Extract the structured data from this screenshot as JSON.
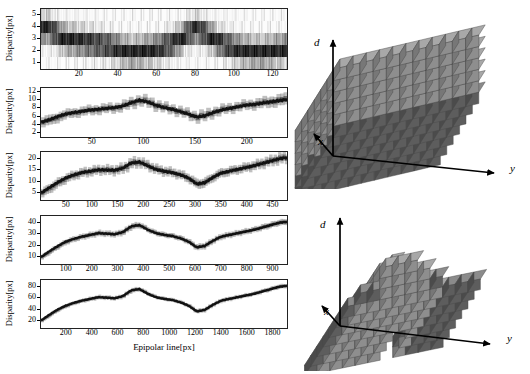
{
  "figure": {
    "background": "#ffffff",
    "ink_color": "#000000"
  },
  "left_panels": {
    "shared_ylabel": "Disparity[px]",
    "shared_xlabel": "Epipolar line[px]"
  },
  "chart_data": [
    {
      "type": "line",
      "name": "scale-1",
      "title": "",
      "xlabel": "",
      "ylabel": "Disparity[px]",
      "xlim": [
        0,
        128
      ],
      "ylim": [
        0.5,
        5.5
      ],
      "xticks": [
        20,
        40,
        60,
        80,
        100,
        120
      ],
      "yticks": [
        1,
        2,
        3,
        4,
        5
      ],
      "grid": false,
      "render": "heatmap-band",
      "x": [
        0,
        4,
        8,
        12,
        16,
        20,
        24,
        28,
        32,
        36,
        40,
        44,
        48,
        52,
        56,
        60,
        64,
        68,
        72,
        76,
        80,
        84,
        88,
        92,
        96,
        100,
        104,
        108,
        112,
        116,
        120,
        124,
        128
      ],
      "values": [
        2.1,
        2.2,
        2.6,
        3.0,
        3.1,
        3.2,
        3.3,
        3.4,
        3.5,
        3.6,
        3.8,
        4.0,
        4.1,
        4.0,
        3.9,
        3.8,
        3.6,
        3.4,
        3.1,
        2.6,
        2.2,
        2.4,
        2.8,
        3.2,
        3.5,
        3.7,
        3.9,
        4.0,
        4.1,
        4.1,
        4.0,
        3.9,
        3.8
      ],
      "band": [
        0.9,
        0.9,
        0.9,
        0.9,
        0.9,
        0.9,
        0.9,
        0.9,
        0.9,
        0.9,
        0.9,
        0.9,
        0.9,
        0.9,
        0.9,
        0.9,
        0.9,
        0.9,
        0.9,
        0.9,
        0.9,
        0.9,
        0.9,
        0.9,
        0.9,
        0.9,
        0.9,
        0.9,
        0.9,
        0.9,
        0.9,
        0.9,
        0.9
      ]
    },
    {
      "type": "line",
      "name": "scale-2",
      "title": "",
      "xlabel": "",
      "ylabel": "Disparity[px]",
      "xlim": [
        0,
        240
      ],
      "ylim": [
        1,
        13
      ],
      "xticks": [
        50,
        100,
        150,
        200
      ],
      "yticks": [
        2,
        4,
        6,
        8,
        10,
        12
      ],
      "grid": false,
      "render": "heatmap-band",
      "x": [
        0,
        8,
        16,
        24,
        32,
        40,
        48,
        56,
        64,
        72,
        80,
        88,
        96,
        104,
        112,
        120,
        128,
        136,
        144,
        152,
        160,
        168,
        176,
        184,
        192,
        200,
        208,
        216,
        224,
        232,
        240
      ],
      "values": [
        4.6,
        5.2,
        6.0,
        6.6,
        7.0,
        7.3,
        7.6,
        7.8,
        8.0,
        8.2,
        8.6,
        9.4,
        10.0,
        9.6,
        8.8,
        8.2,
        7.8,
        7.2,
        6.6,
        5.9,
        6.2,
        7.0,
        7.6,
        8.0,
        8.4,
        8.8,
        9.0,
        9.3,
        9.6,
        9.9,
        10.2
      ],
      "band": [
        2.0,
        2.0,
        1.9,
        1.8,
        1.8,
        1.8,
        1.8,
        1.8,
        1.8,
        1.8,
        1.9,
        2.0,
        2.0,
        2.0,
        1.9,
        1.8,
        1.8,
        1.8,
        1.8,
        2.0,
        2.0,
        1.9,
        1.8,
        1.8,
        1.8,
        1.8,
        1.9,
        2.0,
        2.1,
        2.2,
        2.4
      ]
    },
    {
      "type": "line",
      "name": "scale-3",
      "title": "",
      "xlabel": "",
      "ylabel": "Disparity[px]",
      "xlim": [
        0,
        480
      ],
      "ylim": [
        2,
        23
      ],
      "xticks": [
        50,
        100,
        150,
        200,
        250,
        300,
        350,
        400,
        450
      ],
      "yticks": [
        5,
        10,
        15,
        20
      ],
      "grid": false,
      "render": "heatmap-band",
      "x": [
        0,
        16,
        32,
        48,
        64,
        80,
        96,
        112,
        128,
        144,
        160,
        176,
        192,
        208,
        224,
        240,
        256,
        272,
        288,
        304,
        320,
        336,
        352,
        368,
        384,
        400,
        416,
        432,
        448,
        464,
        480
      ],
      "values": [
        5.0,
        7.4,
        9.6,
        11.6,
        13.0,
        14.0,
        14.6,
        15.2,
        15.1,
        15.0,
        16.0,
        18.2,
        18.6,
        17.0,
        15.4,
        14.6,
        14.0,
        13.0,
        11.6,
        9.0,
        9.6,
        12.0,
        13.8,
        14.6,
        15.4,
        16.2,
        17.0,
        18.0,
        19.0,
        20.0,
        20.6
      ],
      "band": [
        3.0,
        3.2,
        3.2,
        3.0,
        3.0,
        3.0,
        3.0,
        3.0,
        3.0,
        3.0,
        3.2,
        3.4,
        3.2,
        3.0,
        3.0,
        3.0,
        3.0,
        3.0,
        3.0,
        3.2,
        3.2,
        3.0,
        3.0,
        3.0,
        3.0,
        3.0,
        3.0,
        3.2,
        3.2,
        3.4,
        3.4
      ]
    },
    {
      "type": "line",
      "name": "scale-4",
      "title": "",
      "xlabel": "",
      "ylabel": "Disparity[px]",
      "xlim": [
        0,
        960
      ],
      "ylim": [
        4,
        46
      ],
      "xticks": [
        100,
        200,
        300,
        400,
        500,
        600,
        700,
        800,
        900
      ],
      "yticks": [
        10,
        20,
        30,
        40
      ],
      "grid": false,
      "render": "heatmap-band",
      "x": [
        0,
        32,
        64,
        96,
        128,
        160,
        192,
        224,
        256,
        288,
        320,
        352,
        384,
        416,
        448,
        480,
        512,
        544,
        576,
        608,
        640,
        672,
        704,
        736,
        768,
        800,
        832,
        864,
        896,
        928,
        960
      ],
      "values": [
        10,
        15,
        19.5,
        23.5,
        26,
        28,
        29.5,
        31,
        30.5,
        30,
        32,
        37,
        38,
        34,
        31,
        29.5,
        28.5,
        26.5,
        23.5,
        18.5,
        20,
        24.5,
        28,
        29.5,
        31,
        32.5,
        34,
        36,
        38,
        40,
        41
      ],
      "band": [
        3.5,
        3.5,
        3.5,
        3.5,
        3.5,
        3.5,
        3.5,
        3.5,
        3.5,
        3.5,
        3.8,
        4.0,
        3.8,
        3.5,
        3.5,
        3.5,
        3.5,
        3.5,
        3.5,
        3.8,
        3.8,
        3.5,
        3.5,
        3.5,
        3.5,
        3.5,
        3.5,
        3.8,
        3.8,
        4.0,
        4.0
      ]
    },
    {
      "type": "line",
      "name": "scale-5",
      "title": "",
      "xlabel": "Epipolar line[px]",
      "ylabel": "Disparity[px]",
      "xlim": [
        0,
        1920
      ],
      "ylim": [
        8,
        92
      ],
      "xticks": [
        200,
        400,
        600,
        800,
        1000,
        1200,
        1400,
        1600,
        1800
      ],
      "yticks": [
        20,
        40,
        60,
        80
      ],
      "grid": false,
      "render": "heatmap-band",
      "x": [
        0,
        64,
        128,
        192,
        256,
        320,
        384,
        448,
        512,
        576,
        640,
        704,
        768,
        832,
        896,
        960,
        1024,
        1088,
        1152,
        1216,
        1280,
        1344,
        1408,
        1472,
        1536,
        1600,
        1664,
        1728,
        1792,
        1856,
        1920
      ],
      "values": [
        21,
        31,
        40,
        47,
        52,
        56,
        59,
        62,
        61,
        60,
        64,
        74,
        76,
        68,
        62,
        59,
        57,
        53,
        47,
        37,
        40,
        49,
        56,
        59,
        62,
        65,
        68,
        72,
        76,
        80,
        82
      ],
      "band": [
        5,
        5,
        5,
        5,
        5,
        5,
        5,
        5,
        5,
        5,
        5.5,
        6,
        5.5,
        5,
        5,
        5,
        5,
        5,
        5,
        5.5,
        5.5,
        5,
        5,
        5,
        5,
        5,
        5,
        5.5,
        5.5,
        6,
        6
      ]
    }
  ],
  "cube_figures": [
    {
      "name": "full-cost-volume",
      "axes": {
        "vertical": "d",
        "depth": "x",
        "horizontal": "y"
      },
      "description": "dense rectangular cost volume of cubes",
      "cube_face_color": "#8e8e8e",
      "cube_top_color": "#a8a8a8",
      "cube_side_color": "#777777",
      "cube_edge_color": "#4a4a4a",
      "dark_cube_color": "#5d5d5d",
      "cols": 11,
      "rows": 7,
      "layers": 6
    },
    {
      "name": "pruned-cost-volume",
      "axes": {
        "vertical": "d",
        "depth": "x",
        "horizontal": "y"
      },
      "description": "sparse staircase cost volume following the disparity surface",
      "cube_face_color": "#8e8e8e",
      "cube_top_color": "#a8a8a8",
      "cube_side_color": "#777777",
      "cube_edge_color": "#4a4a4a",
      "dark_cube_color": "#5d5d5d",
      "cols": 11,
      "rows": 7,
      "layers": 3
    }
  ]
}
